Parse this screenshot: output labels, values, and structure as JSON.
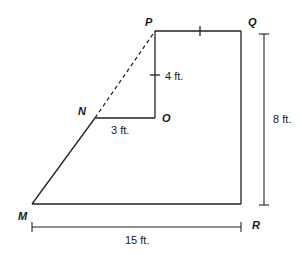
{
  "diagram": {
    "type": "composite-figure",
    "vertices": {
      "P": {
        "label": "P",
        "x": 155,
        "y": 31
      },
      "Q": {
        "label": "Q",
        "x": 241,
        "y": 31
      },
      "R": {
        "label": "R",
        "x": 241,
        "y": 204
      },
      "M": {
        "label": "M",
        "x": 32,
        "y": 204
      },
      "N": {
        "label": "N",
        "x": 95,
        "y": 118
      },
      "O": {
        "label": "O",
        "x": 155,
        "y": 118
      }
    },
    "edges": [
      {
        "from": "P",
        "to": "Q",
        "style": "solid",
        "tick": true
      },
      {
        "from": "Q",
        "to": "R",
        "style": "solid"
      },
      {
        "from": "R",
        "to": "M",
        "style": "solid"
      },
      {
        "from": "M",
        "to": "N",
        "style": "solid"
      },
      {
        "from": "N",
        "to": "O",
        "style": "solid"
      },
      {
        "from": "O",
        "to": "P",
        "style": "solid",
        "tick": true
      },
      {
        "from": "N",
        "to": "P",
        "style": "dashed"
      }
    ],
    "measurements": {
      "po": "4 ft.",
      "no": "3 ft.",
      "height": "8 ft.",
      "base": "15 ft."
    }
  }
}
